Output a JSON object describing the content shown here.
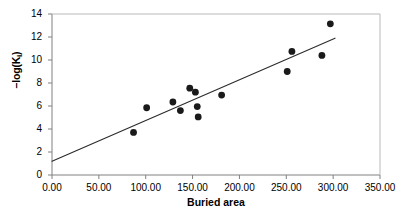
{
  "chart_data": {
    "type": "scatter",
    "title": "",
    "xlabel": "Buried area",
    "ylabel": "-log(Ki)",
    "ylabel_main": "–log(K",
    "ylabel_sub": "i",
    "ylabel_tail": ")",
    "xlim": [
      0,
      350
    ],
    "ylim": [
      0,
      14
    ],
    "xticks": [
      0,
      50,
      100,
      150,
      200,
      250,
      300,
      350
    ],
    "xtick_labels": [
      "0.00",
      "50.00",
      "100.00",
      "150.00",
      "200.00",
      "250.00",
      "300.00",
      "350.00"
    ],
    "yticks": [
      0,
      2,
      4,
      6,
      8,
      10,
      12,
      14
    ],
    "ytick_labels": [
      "0",
      "2",
      "4",
      "6",
      "8",
      "10",
      "12",
      "14"
    ],
    "grid": false,
    "legend": false,
    "marker": {
      "shape": "circle",
      "color": "#1a1a1a",
      "radius": 3.4
    },
    "points": [
      {
        "x": 87,
        "y": 3.7
      },
      {
        "x": 101,
        "y": 5.85
      },
      {
        "x": 129,
        "y": 6.35
      },
      {
        "x": 137,
        "y": 5.6
      },
      {
        "x": 147,
        "y": 7.55
      },
      {
        "x": 153,
        "y": 7.2
      },
      {
        "x": 155,
        "y": 5.95
      },
      {
        "x": 156,
        "y": 5.05
      },
      {
        "x": 181,
        "y": 6.95
      },
      {
        "x": 251,
        "y": 9.0
      },
      {
        "x": 256,
        "y": 10.75
      },
      {
        "x": 288,
        "y": 10.4
      },
      {
        "x": 297,
        "y": 13.15
      }
    ],
    "trendline": {
      "type": "linear",
      "x_start": 0,
      "y_start": 1.2,
      "x_end": 302,
      "y_end": 11.9,
      "color": "#2b2b2b",
      "width": 1.1
    },
    "axis_color": "#808080",
    "frame": {
      "left_axis": true,
      "bottom_axis": true,
      "top_border": true,
      "right_border": true
    }
  }
}
